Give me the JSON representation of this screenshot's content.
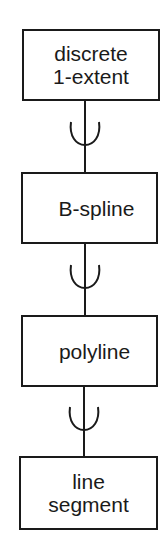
{
  "diagram": {
    "type": "hierarchy",
    "relation_symbol": "subset-of (cup with line)",
    "nodes": [
      {
        "id": "discrete-1-extent",
        "lines": [
          "discrete",
          "1-extent"
        ]
      },
      {
        "id": "b-spline",
        "lines": [
          "B-spline"
        ]
      },
      {
        "id": "polyline",
        "lines": [
          "polyline"
        ]
      },
      {
        "id": "line-segment",
        "lines": [
          "line",
          "segment"
        ]
      }
    ],
    "edges": [
      {
        "from": "discrete-1-extent",
        "to": "b-spline",
        "symbol": "cup"
      },
      {
        "from": "b-spline",
        "to": "polyline",
        "symbol": "cup"
      },
      {
        "from": "polyline",
        "to": "line-segment",
        "symbol": "cup"
      }
    ],
    "colors": {
      "stroke": "#1a1a1a",
      "background": "#ffffff"
    }
  }
}
